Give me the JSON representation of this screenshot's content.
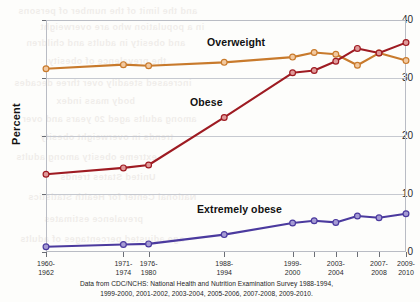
{
  "chart_data": {
    "type": "line",
    "title": "",
    "xlabel": "",
    "ylabel": "Percent",
    "ylim": [
      0,
      40
    ],
    "yticks": [
      0,
      10,
      20,
      30,
      40
    ],
    "grid": true,
    "legend_position": "inline-labels",
    "categories": [
      "1960-1962",
      "1971-1974",
      "1976-1980",
      "1988-1994",
      "1999-2000",
      "2001-2002",
      "2003-2004",
      "2005-2006",
      "2007-2008",
      "2009-2010"
    ],
    "tick_labels": [
      {
        "line1": "1960-",
        "line2": "1962"
      },
      {
        "line1": "1971-",
        "line2": "1974"
      },
      {
        "line1": "1976-",
        "line2": "1980"
      },
      {
        "line1": "1988-",
        "line2": "1994"
      },
      {
        "line1": "1999-",
        "line2": "2000"
      },
      {
        "line1": "2003-",
        "line2": "2004"
      },
      {
        "line1": "2007-",
        "line2": "2008"
      },
      {
        "line1": "2009-",
        "line2": "2010"
      }
    ],
    "ytick_labels": [
      "0",
      "10",
      "20",
      "30",
      "40"
    ],
    "series": [
      {
        "name": "Overweight",
        "color": "#C87A2C",
        "marker_fill": "#F2C9A0",
        "values": [
          31.6,
          32.3,
          32.1,
          32.7,
          33.6,
          34.4,
          34.1,
          32.2,
          34.3,
          33.0
        ]
      },
      {
        "name": "Obese",
        "color": "#9E1B22",
        "marker_fill": "#E09A9A",
        "values": [
          13.4,
          14.5,
          15.0,
          23.2,
          30.9,
          31.3,
          32.9,
          35.1,
          34.3,
          36.1
        ]
      },
      {
        "name": "Extremely obese",
        "color": "#4B3A9E",
        "marker_fill": "#A59BD4",
        "values": [
          0.9,
          1.3,
          1.4,
          3.0,
          5.0,
          5.4,
          5.1,
          6.2,
          5.9,
          6.6
        ]
      }
    ],
    "source_note": {
      "line1": "Data from CDC/NCHS: National Health and Nutrition Examination Survey 1988-1994,",
      "line2": "1999-2000, 2001-2002, 2003-2004, 2005-2006, 2007-2008, 2009-2010."
    }
  },
  "bleed_text": [
    {
      "x": 18,
      "y": 6,
      "text": "and the limit of the number of persons"
    },
    {
      "x": 40,
      "y": 22,
      "text": "in a population who are overweight"
    },
    {
      "x": 26,
      "y": 38,
      "text": "and obesity in adults and children"
    },
    {
      "x": 48,
      "y": 56,
      "text": "the prevalence of obesity"
    },
    {
      "x": 14,
      "y": 78,
      "text": "increased steadily over three decades"
    },
    {
      "x": 56,
      "y": 96,
      "text": "body mass index"
    },
    {
      "x": 22,
      "y": 114,
      "text": "among adults aged 20 years and over"
    },
    {
      "x": 40,
      "y": 132,
      "text": "trends in overweight obesity"
    },
    {
      "x": 16,
      "y": 152,
      "text": "extreme obesity among adults"
    },
    {
      "x": 60,
      "y": 172,
      "text": "United States trends"
    },
    {
      "x": 28,
      "y": 192,
      "text": "National Center for Health Statistics"
    },
    {
      "x": 44,
      "y": 214,
      "text": "prevalence estimates"
    },
    {
      "x": 20,
      "y": 234,
      "text": "age adjusted percentages of adults"
    }
  ]
}
